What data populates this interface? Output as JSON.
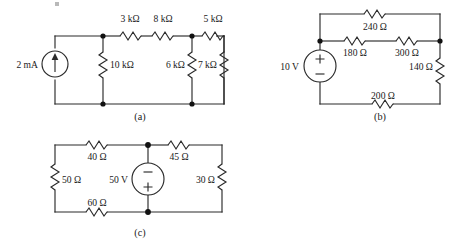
{
  "figure": {
    "background_color": "#ffffff",
    "line_color": "#2a2a2a"
  },
  "circuits": [
    {
      "id": "circuit-a",
      "caption": "(a)",
      "source": {
        "type": "current-source",
        "label": "2 mA",
        "arrow_direction": "up"
      },
      "resistors": [
        {
          "name": "r-10k",
          "label": "10 kΩ",
          "orientation": "vertical"
        },
        {
          "name": "r-3k",
          "label": "3 kΩ",
          "orientation": "horizontal"
        },
        {
          "name": "r-8k",
          "label": "8 kΩ",
          "orientation": "horizontal"
        },
        {
          "name": "r-5k",
          "label": "5 kΩ",
          "orientation": "horizontal"
        },
        {
          "name": "r-6k",
          "label": "6 kΩ",
          "orientation": "vertical"
        },
        {
          "name": "r-7k",
          "label": "7 kΩ",
          "orientation": "vertical"
        }
      ]
    },
    {
      "id": "circuit-b",
      "caption": "(b)",
      "source": {
        "type": "voltage-source",
        "label": "10 V",
        "plus_position": "top",
        "minus_position": "bottom"
      },
      "resistors": [
        {
          "name": "r-240",
          "label": "240 Ω",
          "orientation": "horizontal"
        },
        {
          "name": "r-180",
          "label": "180 Ω",
          "orientation": "horizontal"
        },
        {
          "name": "r-300",
          "label": "300 Ω",
          "orientation": "horizontal"
        },
        {
          "name": "r-140",
          "label": "140 Ω",
          "orientation": "vertical"
        },
        {
          "name": "r-200",
          "label": "200 Ω",
          "orientation": "horizontal"
        }
      ]
    },
    {
      "id": "circuit-c",
      "caption": "(c)",
      "source": {
        "type": "voltage-source",
        "label": "50 V",
        "plus_position": "bottom",
        "minus_position": "top"
      },
      "resistors": [
        {
          "name": "r-40",
          "label": "40 Ω",
          "orientation": "horizontal"
        },
        {
          "name": "r-45",
          "label": "45 Ω",
          "orientation": "horizontal"
        },
        {
          "name": "r-50",
          "label": "50 Ω",
          "orientation": "vertical"
        },
        {
          "name": "r-30",
          "label": "30 Ω",
          "orientation": "vertical"
        },
        {
          "name": "r-60",
          "label": "60 Ω",
          "orientation": "horizontal"
        }
      ]
    }
  ],
  "signs": {
    "plus": "+",
    "minus": "−"
  }
}
